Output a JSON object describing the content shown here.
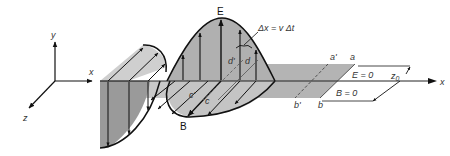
{
  "diagram": {
    "type": "electromagnetic-plane-wave-pulse",
    "axes": {
      "y_label": "y",
      "x_label": "x",
      "z_label": "z"
    },
    "field_labels": {
      "electric": "E",
      "magnetic": "B"
    },
    "displacement_label": "Δx = v Δt",
    "points": {
      "a": "a",
      "a_prime": "a'",
      "b": "b",
      "b_prime": "b'",
      "c": "c",
      "c_prime": "c'",
      "d": "d",
      "d_prime": "d'"
    },
    "region_labels": {
      "e_zero": "E = 0",
      "b_zero": "B = 0",
      "z0": "z",
      "z0_sub": "0"
    },
    "colors": {
      "light_fill": "#c9c9c9",
      "mid_fill": "#a9a9a9",
      "dark_fill": "#8f8f8f",
      "band_fill": "#b4b4b4",
      "stroke": "#111111"
    }
  }
}
